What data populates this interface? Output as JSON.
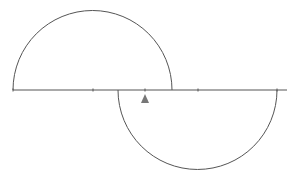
{
  "diagram": {
    "type": "geometry",
    "colors": {
      "stroke": "#555555",
      "fulcrum": "#777777",
      "background": "#ffffff"
    },
    "baseline": {
      "x1": 13,
      "x2": 287,
      "y": 90
    },
    "ticks": [
      13,
      93,
      145,
      198,
      277
    ],
    "upper_semicircle": {
      "cx": 92.5,
      "cy": 90,
      "r": 79.5
    },
    "lower_semicircle": {
      "cx": 197.5,
      "cy": 90,
      "r": 79.5
    },
    "fulcrum": {
      "x": 145,
      "y_top": 94,
      "y_bottom": 103,
      "half_width": 4
    }
  }
}
